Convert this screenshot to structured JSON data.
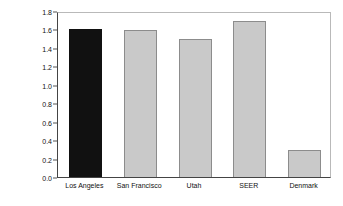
{
  "chart_data": {
    "type": "bar",
    "title": "",
    "subtitle": "",
    "xlabel": "",
    "ylabel_line1": "Annual Incidence",
    "ylabel_line2": "(per 100,000)",
    "ylabel": "Annual Incidence (per 100,000)",
    "categories": [
      "Los Angeles",
      "San Francisco",
      "Utah",
      "SEER",
      "Denmark"
    ],
    "values": [
      1.6,
      1.59,
      1.5,
      1.69,
      0.29
    ],
    "ylim": [
      0.0,
      1.8
    ],
    "ytick_labels": [
      "0.0",
      "0.2",
      "0.4",
      "0.6",
      "0.8",
      "1.0",
      "1.2",
      "1.4",
      "1.6",
      "1.8"
    ],
    "ytick_values": [
      0.0,
      0.2,
      0.4,
      0.6,
      0.8,
      1.0,
      1.2,
      1.4,
      1.6,
      1.8
    ],
    "grid": false,
    "legend": "none",
    "bar_colors": [
      "#111111",
      "#c9c9c9",
      "#c9c9c9",
      "#c9c9c9",
      "#c9c9c9"
    ],
    "bar_edge_color": "#8c8c8c",
    "highlight_category": "Los Angeles",
    "axis_color": "#444444",
    "frame_color": "#b9b9b9",
    "background": "#ffffff"
  }
}
